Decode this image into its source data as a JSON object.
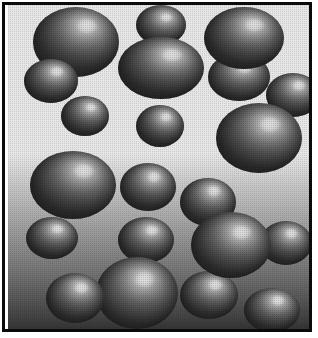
{
  "figure": {
    "width": 318,
    "height": 338,
    "render_style": "halftone-dithered grayscale",
    "frame": {
      "border_color": "#0b0b0b",
      "border_width": 3,
      "matte_color": "#ffffff"
    },
    "background": {
      "type": "vertical-gradient",
      "top_color": "#ffffff",
      "bottom_color": "#3a3a3a",
      "gradient_start_pct": 46,
      "gradient_end_pct": 100
    },
    "lighting": {
      "highlight_position": "upper-right",
      "highlight_x_pct": 62,
      "highlight_y_pct": 30,
      "specular_color": "#ffffff",
      "terminator_color": "#343434"
    },
    "object_count": 21
  },
  "spheres": [
    {
      "id": "sphere-01",
      "label": "large top-left",
      "x": 25,
      "y": 2,
      "w": 86,
      "h": 70,
      "hx": 62,
      "hy": 26,
      "z": 6
    },
    {
      "id": "sphere-02",
      "label": "medium left-upper",
      "x": 16,
      "y": 54,
      "w": 54,
      "h": 44,
      "hx": 60,
      "hy": 28,
      "z": 7
    },
    {
      "id": "sphere-03",
      "label": "small left-mid",
      "x": 53,
      "y": 91,
      "w": 48,
      "h": 40,
      "hx": 62,
      "hy": 28,
      "z": 5
    },
    {
      "id": "sphere-04",
      "label": "small top-center-upper",
      "x": 128,
      "y": 0,
      "w": 50,
      "h": 40,
      "hx": 60,
      "hy": 30,
      "z": 6
    },
    {
      "id": "sphere-05",
      "label": "large top-center",
      "x": 110,
      "y": 32,
      "w": 86,
      "h": 62,
      "hx": 62,
      "hy": 28,
      "z": 8
    },
    {
      "id": "sphere-06",
      "label": "small center",
      "x": 128,
      "y": 100,
      "w": 48,
      "h": 42,
      "hx": 62,
      "hy": 28,
      "z": 5
    },
    {
      "id": "sphere-07",
      "label": "large top-right",
      "x": 196,
      "y": 2,
      "w": 80,
      "h": 62,
      "hx": 62,
      "hy": 28,
      "z": 7
    },
    {
      "id": "sphere-08",
      "label": "medium right-upper",
      "x": 200,
      "y": 48,
      "w": 62,
      "h": 48,
      "hx": 58,
      "hy": 30,
      "z": 6
    },
    {
      "id": "sphere-09",
      "label": "medium far-right-upper",
      "x": 258,
      "y": 68,
      "w": 54,
      "h": 44,
      "hx": 60,
      "hy": 28,
      "z": 5
    },
    {
      "id": "sphere-10",
      "label": "large right-mid",
      "x": 208,
      "y": 98,
      "w": 86,
      "h": 70,
      "hx": 62,
      "hy": 30,
      "z": 7
    },
    {
      "id": "sphere-11",
      "label": "large left-lower-mid",
      "x": 22,
      "y": 146,
      "w": 86,
      "h": 68,
      "hx": 62,
      "hy": 28,
      "z": 6
    },
    {
      "id": "sphere-12",
      "label": "medium center-mid",
      "x": 112,
      "y": 158,
      "w": 56,
      "h": 48,
      "hx": 60,
      "hy": 28,
      "z": 5
    },
    {
      "id": "sphere-13",
      "label": "medium right-center",
      "x": 172,
      "y": 173,
      "w": 56,
      "h": 48,
      "hx": 60,
      "hy": 26,
      "z": 6
    },
    {
      "id": "sphere-14",
      "label": "small left-lower",
      "x": 18,
      "y": 212,
      "w": 52,
      "h": 42,
      "hx": 60,
      "hy": 28,
      "z": 5
    },
    {
      "id": "sphere-15",
      "label": "medium center-lower",
      "x": 110,
      "y": 212,
      "w": 56,
      "h": 46,
      "hx": 60,
      "hy": 28,
      "z": 5
    },
    {
      "id": "sphere-16",
      "label": "large right-lower",
      "x": 183,
      "y": 207,
      "w": 80,
      "h": 66,
      "hx": 62,
      "hy": 30,
      "z": 7
    },
    {
      "id": "sphere-17",
      "label": "medium far-right-lower",
      "x": 252,
      "y": 216,
      "w": 52,
      "h": 44,
      "hx": 60,
      "hy": 28,
      "z": 5
    },
    {
      "id": "sphere-18",
      "label": "large bottom-center",
      "x": 88,
      "y": 252,
      "w": 82,
      "h": 72,
      "hx": 58,
      "hy": 30,
      "z": 8
    },
    {
      "id": "sphere-19",
      "label": "medium bottom-left",
      "x": 38,
      "y": 268,
      "w": 58,
      "h": 50,
      "hx": 60,
      "hy": 28,
      "z": 9
    },
    {
      "id": "sphere-20",
      "label": "medium bottom-right",
      "x": 172,
      "y": 266,
      "w": 58,
      "h": 48,
      "hx": 60,
      "hy": 28,
      "z": 6
    },
    {
      "id": "sphere-21",
      "label": "medium far-bottom-right",
      "x": 236,
      "y": 283,
      "w": 56,
      "h": 44,
      "hx": 60,
      "hy": 28,
      "z": 5
    }
  ]
}
